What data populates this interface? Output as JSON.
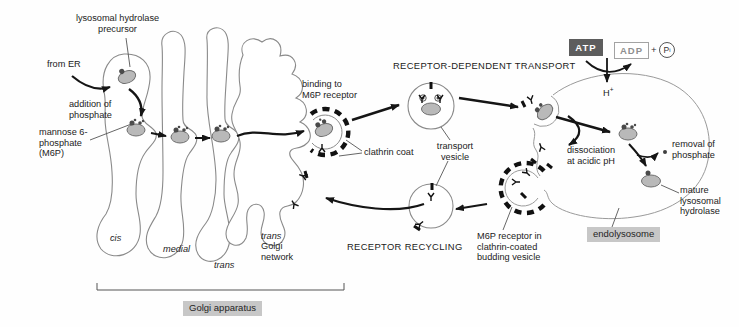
{
  "figure": "lysosomal-hydrolase-transport-pathway",
  "palette": {
    "membrane": "#8a8a8a",
    "ink": "#151515",
    "molecule_fill": "#b9b9b9",
    "molecule_stroke": "#6f6f6f",
    "highlight_bg": "#c7c7c7",
    "atp_bg": "#5d5d5d",
    "adp_text": "#8f8f8f"
  },
  "headings": {
    "receptor_dependent_transport": "RECEPTOR-DEPENDENT TRANSPORT",
    "receptor_recycling": "RECEPTOR RECYCLING"
  },
  "labels": {
    "lysosomal_precursor": "lysosomal hydrolase\nprecursor",
    "from_er": "from ER",
    "addition_phosphate": "addition of\nphosphate",
    "m6p": "mannose 6-\nphosphate\n(M6P)",
    "binding": "binding to\nM6P receptor",
    "clathrin_coat": "clathrin coat",
    "transport_vesicle": "transport\nvesicle",
    "dissociation": "dissociation\nat acidic pH",
    "removal": "removal of\nphosphate",
    "mature": "mature\nlysosomal\nhydrolase",
    "m6p_bud": "M6P receptor in\nclathrin-coated\nbudding vesicle"
  },
  "golgi": {
    "cis": "cis",
    "medial": "medial",
    "trans": "trans",
    "tgn_trans": "trans",
    "tgn_rest": "Golgi\nnetwork",
    "apparatus": "Golgi apparatus"
  },
  "organelles": {
    "endolysosome": "endolysosome"
  },
  "energy": {
    "atp": "ATP",
    "adp": "ADP",
    "plus": "+",
    "pi_symbol": "P",
    "pi_sub": "i",
    "proton": "H",
    "proton_sup": "+"
  }
}
